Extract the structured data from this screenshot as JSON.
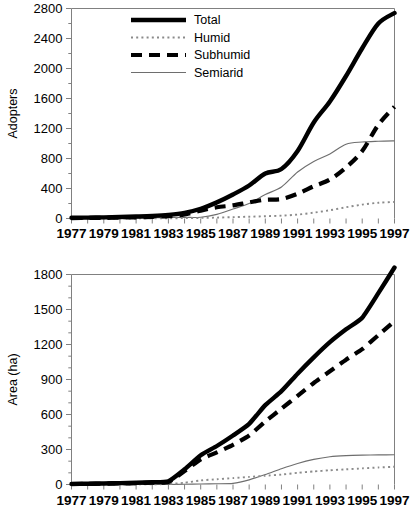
{
  "figure": {
    "background": "#ffffff",
    "series_colors": {
      "total": "#000000",
      "subhumid": "#000000",
      "humid": "#8a8a8a",
      "semiarid": "#6e6e6e",
      "axis": "#808080"
    }
  },
  "legend": {
    "position": "top-left-inside",
    "entries": [
      {
        "key": "total",
        "label": "Total",
        "style": "thick-solid-black"
      },
      {
        "key": "humid",
        "label": "Humid",
        "style": "fine-dotted-gray"
      },
      {
        "key": "subhumid",
        "label": "Subhumid",
        "style": "thick-dashed-black"
      },
      {
        "key": "semiarid",
        "label": "Semiarid",
        "style": "thin-solid-gray"
      }
    ]
  },
  "chart_data": [
    {
      "id": "adopters",
      "type": "line",
      "title": "",
      "xlabel": "",
      "ylabel": "Adopters",
      "xlim": [
        1977,
        1997
      ],
      "ylim": [
        0,
        2800
      ],
      "ytick_step": 400,
      "yminor_step": 200,
      "xtick_step": 1,
      "xlabel_step": 2,
      "grid": false,
      "legend_position": "top-left",
      "x": [
        1977,
        1978,
        1979,
        1980,
        1981,
        1982,
        1983,
        1984,
        1985,
        1986,
        1987,
        1988,
        1989,
        1990,
        1991,
        1992,
        1993,
        1994,
        1995,
        1996,
        1997
      ],
      "xtick_labels": [
        "1977",
        "1979",
        "1981",
        "1983",
        "1985",
        "1987",
        "1989",
        "1991",
        "1993",
        "1995",
        "1997"
      ],
      "ytick_labels": [
        "0",
        "400",
        "800",
        "1200",
        "1600",
        "2000",
        "2400",
        "2800"
      ],
      "series": [
        {
          "name": "Total",
          "key": "total",
          "values": [
            10,
            12,
            15,
            20,
            26,
            34,
            48,
            75,
            130,
            215,
            320,
            440,
            600,
            660,
            900,
            1280,
            1560,
            1900,
            2270,
            2600,
            2740
          ]
        },
        {
          "name": "Humid",
          "key": "humid",
          "values": [
            0,
            0,
            0,
            0,
            1,
            2,
            3,
            5,
            8,
            12,
            18,
            24,
            30,
            38,
            52,
            78,
            110,
            150,
            185,
            210,
            220
          ]
        },
        {
          "name": "Subhumid",
          "key": "subhumid",
          "values": [
            6,
            7,
            9,
            12,
            16,
            22,
            32,
            55,
            105,
            150,
            175,
            215,
            250,
            260,
            330,
            430,
            520,
            680,
            900,
            1250,
            1490
          ]
        },
        {
          "name": "Semiarid",
          "key": "semiarid",
          "values": [
            4,
            5,
            6,
            8,
            9,
            10,
            13,
            15,
            17,
            55,
            127,
            200,
            320,
            420,
            620,
            760,
            860,
            990,
            1020,
            1030,
            1035
          ]
        }
      ]
    },
    {
      "id": "area",
      "type": "line",
      "title": "",
      "xlabel": "",
      "ylabel": "Area (ha)",
      "xlim": [
        1977,
        1997
      ],
      "ylim": [
        0,
        1800
      ],
      "ytick_step": 300,
      "yminor_step": 100,
      "xtick_step": 1,
      "xlabel_step": 2,
      "grid": false,
      "legend_position": "none",
      "x": [
        1977,
        1978,
        1979,
        1980,
        1981,
        1982,
        1983,
        1984,
        1985,
        1986,
        1987,
        1988,
        1989,
        1990,
        1991,
        1992,
        1993,
        1994,
        1995,
        1996,
        1997
      ],
      "xtick_labels": [
        "1977",
        "1979",
        "1981",
        "1983",
        "1985",
        "1987",
        "1989",
        "1991",
        "1993",
        "1995",
        "1997"
      ],
      "ytick_labels": [
        "0",
        "300",
        "600",
        "900",
        "1200",
        "1500",
        "1800"
      ],
      "series": [
        {
          "name": "Total",
          "key": "total",
          "values": [
            5,
            7,
            9,
            12,
            15,
            20,
            28,
            130,
            250,
            330,
            420,
            520,
            680,
            800,
            950,
            1090,
            1220,
            1330,
            1430,
            1640,
            1860
          ]
        },
        {
          "name": "Humid",
          "key": "humid",
          "values": [
            0,
            0,
            0,
            0,
            1,
            2,
            4,
            15,
            35,
            45,
            55,
            65,
            75,
            85,
            100,
            112,
            122,
            130,
            138,
            146,
            152
          ]
        },
        {
          "name": "Subhumid",
          "key": "subhumid",
          "values": [
            4,
            5,
            7,
            9,
            12,
            16,
            22,
            115,
            215,
            275,
            340,
            420,
            540,
            650,
            760,
            870,
            970,
            1070,
            1160,
            1280,
            1400
          ]
        },
        {
          "name": "Semiarid",
          "key": "semiarid",
          "values": [
            0,
            0,
            0,
            0,
            0,
            0,
            0,
            2,
            4,
            6,
            10,
            40,
            85,
            135,
            180,
            215,
            238,
            248,
            252,
            254,
            255
          ]
        }
      ]
    }
  ]
}
